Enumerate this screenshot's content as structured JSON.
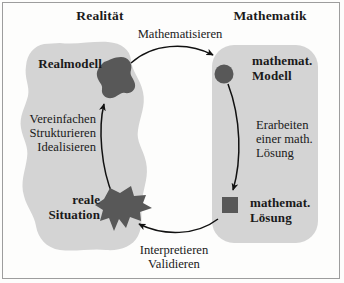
{
  "diagram": {
    "title_left": "Realität",
    "title_right": "Mathematik",
    "colors": {
      "region_fill": "#d4d4d4",
      "node_fill": "#585858",
      "arrow_stroke": "#111111",
      "frame": "#9d9d9d",
      "page_background": "#fdfdfc",
      "text": "#1a1a1a"
    },
    "regions": [
      {
        "name": "reality-region",
        "shape": "irregular-blob"
      },
      {
        "name": "mathematics-region",
        "shape": "rounded-rectangle"
      }
    ],
    "nodes": [
      {
        "id": "realmodell",
        "label": "Realmodell",
        "marker": "irregular-blob",
        "side": "left",
        "bold": true
      },
      {
        "id": "reale-situation",
        "label": "reale\nSituation",
        "label_line1": "reale",
        "label_line2": "Situation",
        "marker": "jagged-blob",
        "side": "left",
        "bold": true
      },
      {
        "id": "mathematisches-modell",
        "label": "mathemat.\nModell",
        "label_line1": "mathemat.",
        "label_line2": "Modell",
        "marker": "circle",
        "side": "right",
        "bold": true
      },
      {
        "id": "mathematische-loesung",
        "label": "mathemat.\nLösung",
        "label_line1": "mathemat.",
        "label_line2": "Lösung",
        "marker": "square",
        "side": "right",
        "bold": true
      }
    ],
    "arrows": [
      {
        "id": "mathematisieren",
        "label": "Mathematisieren",
        "from": "realmodell",
        "to": "mathematisches-modell",
        "position": "top"
      },
      {
        "id": "erarbeiten",
        "label": "Erarbeiten\neiner math.\nLösung",
        "label_line1": "Erarbeiten",
        "label_line2": "einer math.",
        "label_line3": "Lösung",
        "from": "mathematisches-modell",
        "to": "mathematische-loesung",
        "position": "right"
      },
      {
        "id": "interpretieren-validieren",
        "label": "Interpretieren\nValidieren",
        "label_line1": "Interpretieren",
        "label_line2": "Validieren",
        "from": "mathematische-loesung",
        "to": "reale-situation",
        "position": "bottom"
      },
      {
        "id": "vereinfachen",
        "label": "Vereinfachen\nStrukturieren\nIdealisieren",
        "label_line1": "Vereinfachen",
        "label_line2": "Strukturieren",
        "label_line3": "Idealisieren",
        "from": "reale-situation",
        "to": "realmodell",
        "position": "left"
      }
    ]
  }
}
